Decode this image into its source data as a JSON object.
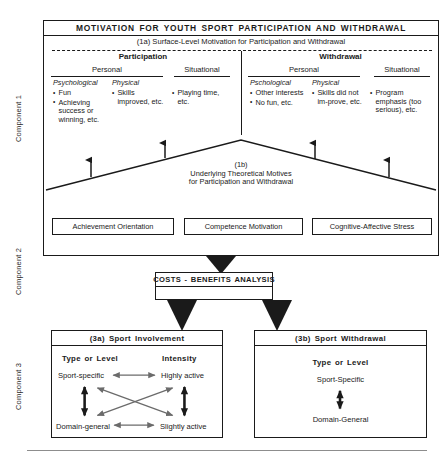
{
  "components": [
    {
      "label": "Component 1"
    },
    {
      "label": "Component 2"
    },
    {
      "label": "Component 3"
    }
  ],
  "component1": {
    "title": "MOTIVATION FOR YOUTH SPORT PARTICIPATION AND WITHDRAWAL",
    "surface_level": {
      "label": "(1a) Surface-Level Motivation for Participation and Withdrawal",
      "sides": [
        {
          "heading": "Participation",
          "groups": [
            {
              "heading": "Personal",
              "subcolumns": [
                {
                  "heading": "Psychological",
                  "items": [
                    "Fun",
                    "Achieving success or winning, etc."
                  ]
                },
                {
                  "heading": "Physical",
                  "items": [
                    "Skills improved, etc."
                  ]
                }
              ]
            },
            {
              "heading": "Situational",
              "subcolumns": [
                {
                  "heading": "",
                  "items": [
                    "Playing time, etc."
                  ]
                }
              ]
            }
          ]
        },
        {
          "heading": "Withdrawal",
          "groups": [
            {
              "heading": "Personal",
              "subcolumns": [
                {
                  "heading": "Pschological",
                  "items": [
                    "Other interests",
                    "No fun, etc."
                  ]
                },
                {
                  "heading": "Physical",
                  "items": [
                    "Skills did not im-prove, etc."
                  ]
                }
              ]
            },
            {
              "heading": "Situational",
              "subcolumns": [
                {
                  "heading": "",
                  "items": [
                    "Program emphasis (too serious), etc."
                  ]
                }
              ]
            }
          ]
        }
      ]
    },
    "underlying": {
      "tag": "(1b)",
      "line1": "Underlying Theoretical Motives",
      "line2": "for Participation and Withdrawal"
    },
    "theory_boxes": [
      "Achievement Orientation",
      "Competence Motivation",
      "Cognitive-Affective Stress"
    ]
  },
  "component2": {
    "title": "COSTS - BENEFITS ANALYSIS"
  },
  "component3": {
    "involvement": {
      "title": "(3a) Sport Involvement",
      "col_headings": [
        "Type or Level",
        "Intensity"
      ],
      "nodes": {
        "top_left": "Sport-specific",
        "top_right": "Highly active",
        "bottom_left": "Domain-general",
        "bottom_right": "Slightly active"
      }
    },
    "withdrawal": {
      "title": "(3b) Sport Withdrawal",
      "col_heading": "Type or Level",
      "nodes": {
        "top": "Sport-Specific",
        "bottom": "Domain-General"
      }
    }
  },
  "colors": {
    "ink": "#1a1a1a",
    "arrow_gray": "#6b6b6b",
    "rule_gray": "#8d8d8d",
    "paper": "#ffffff"
  }
}
